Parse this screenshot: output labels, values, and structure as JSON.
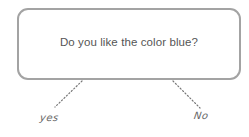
{
  "diagram": {
    "type": "decision-tree",
    "question": {
      "text": "Do you like the color blue?"
    },
    "answers": [
      {
        "label": "yes"
      },
      {
        "label": "No"
      }
    ],
    "colors": {
      "box_border": "#a3a3a3",
      "question_text": "#555555",
      "connector": "#777777",
      "answer_text": "#666666"
    }
  }
}
